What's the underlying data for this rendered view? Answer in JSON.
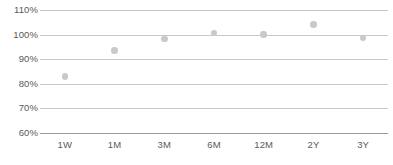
{
  "chart_data": {
    "type": "scatter",
    "title": "",
    "subtitle": "",
    "xlabel": "",
    "ylabel": "",
    "categories": [
      "1W",
      "1M",
      "3M",
      "6M",
      "12M",
      "2Y",
      "3Y"
    ],
    "values": [
      83,
      93.5,
      98.3,
      100.7,
      100,
      104.2,
      98.7
    ],
    "series": [
      {
        "name": "",
        "values": [
          83,
          93.5,
          98.3,
          100.7,
          100,
          104.2,
          98.7
        ]
      }
    ],
    "ylim": [
      60,
      110
    ],
    "ytick_values": [
      110,
      100,
      90,
      80,
      70,
      60
    ],
    "ytick_labels": [
      "110%",
      "100%",
      "90%",
      "80%",
      "70%",
      "60%"
    ],
    "grid": true,
    "grid_axis": "y",
    "legend": false,
    "legend_position": "none",
    "marker": "circle",
    "marker_color": "#c9c9c9",
    "gridline_color": "#c8c8c8",
    "baseline_color": "#9a9a9a",
    "tick_label_color": "#59595b",
    "background_color": "#ffffff",
    "annotations": []
  }
}
